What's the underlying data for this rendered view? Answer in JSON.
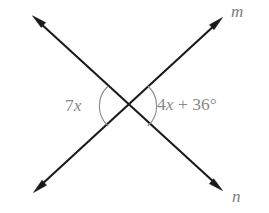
{
  "figure": {
    "background_color": "#ffffff",
    "line_color": "#1a1a1a",
    "arc_color": "#8d8d8d",
    "label_color": "#8a8a8a",
    "intersection": {
      "x": 128,
      "y": 106
    }
  },
  "lines": [
    {
      "name": "line-m",
      "label": "m",
      "label_position": {
        "x": 231,
        "y": 3
      },
      "from": {
        "x": 34,
        "y": 192
      },
      "to": {
        "x": 222,
        "y": 18
      },
      "arrow_start": true,
      "arrow_end": true
    },
    {
      "name": "line-n",
      "label": "n",
      "label_position": {
        "x": 232,
        "y": 188
      },
      "from": {
        "x": 33,
        "y": 16
      },
      "to": {
        "x": 222,
        "y": 190
      },
      "arrow_start": true,
      "arrow_end": true
    }
  ],
  "angles": [
    {
      "name": "angle-left",
      "expression": "7x",
      "expression_parts": [
        {
          "text": "7",
          "style": "upright"
        },
        {
          "text": "x",
          "style": "italic"
        }
      ],
      "arc_radius": 27,
      "arc_side": "left",
      "label_position": {
        "x": 65,
        "y": 97
      }
    },
    {
      "name": "angle-right",
      "expression": "4x + 36°",
      "expression_parts": [
        {
          "text": "4",
          "style": "upright"
        },
        {
          "text": "x",
          "style": "italic"
        },
        {
          "text": " + 36°",
          "style": "upright"
        }
      ],
      "arc_radius": 27,
      "arc_side": "right",
      "label_position": {
        "x": 157,
        "y": 96
      }
    }
  ],
  "labels": {
    "line_m": "m",
    "line_n": "n",
    "angle_left_num": "7",
    "angle_left_var": "x",
    "angle_right_num": "4",
    "angle_right_var": "x",
    "angle_right_rest": " + 36°"
  }
}
